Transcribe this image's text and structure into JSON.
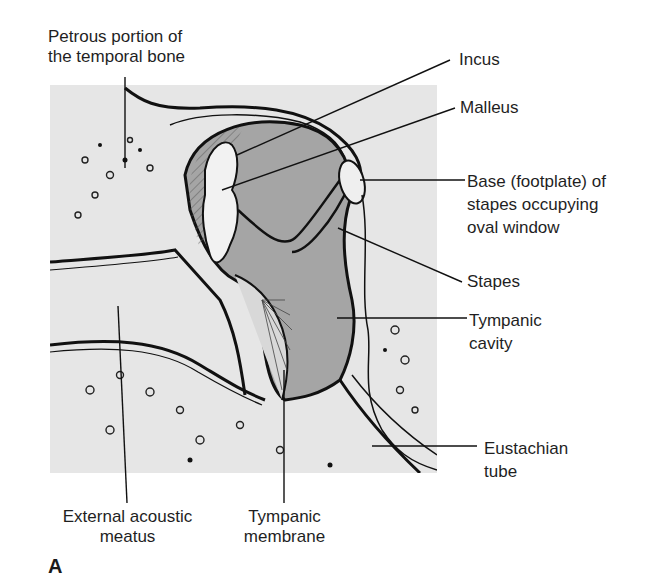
{
  "figure": {
    "panel_letter": "A",
    "colors": {
      "panel_bg": "#e6e6e6",
      "cavity": "#a9a9a9",
      "line": "#111111"
    },
    "labels": {
      "petrous": {
        "line1": "Petrous portion of",
        "line2": "the temporal bone"
      },
      "incus": {
        "line1": "Incus"
      },
      "malleus": {
        "line1": "Malleus"
      },
      "footplate": {
        "line1": "Base (footplate) of",
        "line2": "stapes occupying",
        "line3": "oval window"
      },
      "stapes": {
        "line1": "Stapes"
      },
      "tympanic_cavity": {
        "line1": "Tympanic",
        "line2": "cavity"
      },
      "eustachian": {
        "line1": "Eustachian",
        "line2": "tube"
      },
      "external_meatus": {
        "line1": "External acoustic",
        "line2": "meatus"
      },
      "tympanic_membrane": {
        "line1": "Tympanic",
        "line2": "membrane"
      }
    }
  }
}
